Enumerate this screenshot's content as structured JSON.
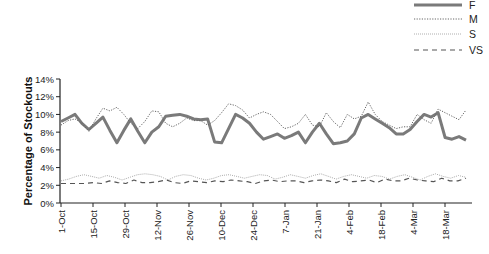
{
  "chart_data": {
    "type": "line",
    "title": "",
    "xlabel": "",
    "ylabel": "Percentage of Stockouts",
    "ylim": [
      0,
      14
    ],
    "yticks": [
      "0%",
      "2%",
      "4%",
      "6%",
      "8%",
      "10%",
      "12%",
      "14%"
    ],
    "x_tick_labels": [
      "1-Oct",
      "15-Oct",
      "29-Oct",
      "12-Nov",
      "26-Nov",
      "10-Dec",
      "24-Dec",
      "7-Jan",
      "21-Jan",
      "4-Feb",
      "18-Feb",
      "4-Mar",
      "18-Mar"
    ],
    "grid": false,
    "legend_position": "top-right",
    "x_points": 51,
    "series": [
      {
        "name": "F",
        "style": "solid-thick",
        "color": "#7a7a7a",
        "values": [
          9.2,
          9.6,
          10.0,
          9.0,
          8.3,
          9.0,
          9.7,
          8.2,
          6.8,
          8.2,
          9.5,
          8.1,
          6.8,
          8.0,
          8.6,
          9.8,
          9.9,
          10.0,
          9.8,
          9.5,
          9.4,
          9.5,
          6.9,
          6.8,
          8.4,
          10.0,
          9.6,
          9.0,
          8.0,
          7.2,
          7.5,
          7.8,
          7.3,
          7.6,
          8.0,
          6.8,
          8.0,
          9.0,
          7.8,
          6.7,
          6.8,
          7.0,
          7.8,
          9.6,
          10.0,
          9.5,
          9.0,
          8.5,
          7.8,
          7.8,
          8.3,
          9.2,
          10.0,
          9.7,
          10.2,
          7.4,
          7.2,
          7.5,
          7.1
        ]
      },
      {
        "name": "M",
        "style": "dotted",
        "color": "#666666",
        "values": [
          8.8,
          9.3,
          9.5,
          9.0,
          8.1,
          9.5,
          10.7,
          10.4,
          10.8,
          10.0,
          9.0,
          8.4,
          9.2,
          10.4,
          10.3,
          9.0,
          8.6,
          9.0,
          9.6,
          9.3,
          9.3,
          8.8,
          9.3,
          10.2,
          11.2,
          11.0,
          10.5,
          9.6,
          10.0,
          10.3,
          10.0,
          9.2,
          8.4,
          8.6,
          9.0,
          10.0,
          8.8,
          8.6,
          10.2,
          9.2,
          8.5,
          10.0,
          9.5,
          9.8,
          11.4,
          10.0,
          9.2,
          8.8,
          8.4,
          8.6,
          8.6,
          10.0,
          9.4,
          9.0,
          10.6,
          10.2,
          9.8,
          9.4,
          10.5
        ]
      },
      {
        "name": "S",
        "style": "fine-dotted",
        "color": "#9a9a9a",
        "values": [
          2.5,
          2.7,
          3.0,
          3.2,
          3.0,
          2.8,
          3.1,
          2.9,
          2.6,
          2.9,
          3.2,
          3.3,
          3.2,
          3.0,
          2.6,
          3.0,
          3.2,
          3.1,
          2.8,
          2.6,
          2.8,
          3.1,
          3.2,
          3.0,
          2.8,
          3.0,
          3.2,
          3.1,
          2.7,
          2.9,
          3.2,
          3.0,
          2.8,
          3.1,
          3.3,
          3.0,
          2.7,
          3.0,
          3.2,
          3.0,
          2.8,
          3.1,
          3.0,
          2.7,
          3.0,
          3.2,
          2.9,
          2.6,
          3.0,
          3.3,
          3.0,
          2.8,
          3.1,
          2.9
        ]
      },
      {
        "name": "VS",
        "style": "dashed",
        "color": "#555555",
        "values": [
          2.2,
          2.2,
          2.2,
          2.2,
          2.3,
          2.2,
          2.5,
          2.3,
          2.2,
          2.6,
          2.3,
          2.3,
          2.4,
          2.6,
          2.3,
          2.2,
          2.5,
          2.4,
          2.3,
          2.5,
          2.4,
          2.6,
          2.5,
          2.4,
          2.2,
          2.5,
          2.6,
          2.4,
          2.5,
          2.5,
          2.3,
          2.5,
          2.6,
          2.5,
          2.3,
          2.7,
          2.4,
          2.5,
          2.6,
          2.3,
          2.7,
          2.5,
          2.5,
          2.8,
          2.6,
          2.5,
          2.4,
          2.8,
          2.5,
          2.5,
          2.8
        ]
      }
    ]
  },
  "legend": {
    "items": [
      {
        "label": "F"
      },
      {
        "label": "M"
      },
      {
        "label": "S"
      },
      {
        "label": "VS"
      }
    ]
  }
}
